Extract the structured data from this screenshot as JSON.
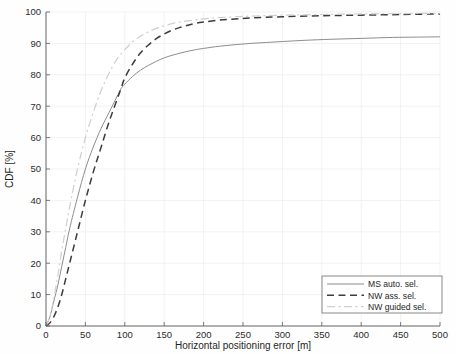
{
  "chart_data": {
    "type": "line",
    "title": "",
    "xlabel": "Horizontal positioning error [m]",
    "ylabel": "CDF [%]",
    "xlim": [
      0,
      500
    ],
    "ylim": [
      0,
      100
    ],
    "xticks": [
      0,
      50,
      100,
      150,
      200,
      250,
      300,
      350,
      400,
      450,
      500
    ],
    "yticks": [
      0,
      10,
      20,
      30,
      40,
      50,
      60,
      70,
      80,
      90,
      100
    ],
    "grid": true,
    "legend_position": "lower right",
    "series": [
      {
        "name": "MS auto. sel.",
        "style": "solid",
        "color": "#8d8d8d",
        "x": [
          0,
          5,
          10,
          15,
          20,
          25,
          30,
          40,
          50,
          60,
          70,
          80,
          90,
          95,
          100,
          110,
          120,
          130,
          140,
          150,
          160,
          170,
          180,
          190,
          200,
          220,
          240,
          260,
          280,
          300,
          330,
          360,
          400,
          440,
          470,
          500
        ],
        "y": [
          0,
          3,
          8,
          13,
          19,
          25,
          31,
          41,
          50,
          57,
          63,
          68,
          73,
          75.5,
          77,
          79.5,
          81.5,
          83,
          84.3,
          85.4,
          86.2,
          86.9,
          87.5,
          88.0,
          88.4,
          89.1,
          89.6,
          90.0,
          90.3,
          90.6,
          91.0,
          91.3,
          91.6,
          91.9,
          92.0,
          92.1
        ]
      },
      {
        "name": "NW ass. sel.",
        "style": "dashed",
        "color": "#3c3c3c",
        "x": [
          0,
          5,
          10,
          15,
          20,
          25,
          30,
          40,
          50,
          60,
          70,
          80,
          90,
          95,
          100,
          110,
          120,
          130,
          140,
          150,
          160,
          170,
          180,
          190,
          200,
          220,
          240,
          260,
          300,
          350,
          400,
          450,
          500
        ],
        "y": [
          0,
          1,
          3,
          6,
          10,
          15,
          20,
          30,
          40,
          49,
          57,
          65,
          72,
          75.5,
          79,
          83.5,
          87,
          89.5,
          91.5,
          93.0,
          94.2,
          95.1,
          95.8,
          96.4,
          96.8,
          97.4,
          97.8,
          98.1,
          98.5,
          98.8,
          99.0,
          99.2,
          99.4
        ]
      },
      {
        "name": "NW guided sel.",
        "style": "dashdot",
        "color": "#cfcfcf",
        "x": [
          0,
          5,
          10,
          15,
          20,
          25,
          30,
          40,
          50,
          60,
          70,
          80,
          90,
          100,
          110,
          120,
          130,
          140,
          150,
          160,
          170,
          180,
          190,
          200,
          220,
          250,
          300,
          350,
          400,
          450,
          500
        ],
        "y": [
          0,
          3,
          9,
          16,
          24,
          31,
          38,
          50,
          60,
          68,
          75,
          80.5,
          85,
          88,
          90.5,
          92.3,
          93.7,
          94.8,
          95.6,
          96.3,
          96.8,
          97.2,
          97.5,
          97.8,
          98.2,
          98.6,
          99.0,
          99.2,
          99.4,
          99.5,
          99.6
        ]
      }
    ]
  },
  "axes": {
    "y_label": "CDF [%]",
    "x_label": "Horizontal positioning error [m]",
    "x_tick_labels": [
      "0",
      "50",
      "100",
      "150",
      "200",
      "250",
      "300",
      "350",
      "400",
      "450",
      "500"
    ],
    "y_tick_labels": [
      "0",
      "10",
      "20",
      "30",
      "40",
      "50",
      "60",
      "70",
      "80",
      "90",
      "100"
    ]
  },
  "legend": {
    "entries": [
      {
        "label": "MS auto. sel.",
        "style": "solid",
        "color": "#8d8d8d"
      },
      {
        "label": "NW ass. sel.",
        "style": "dashed",
        "color": "#3c3c3c"
      },
      {
        "label": "NW guided sel.",
        "style": "dashdot",
        "color": "#cfcfcf"
      }
    ]
  }
}
